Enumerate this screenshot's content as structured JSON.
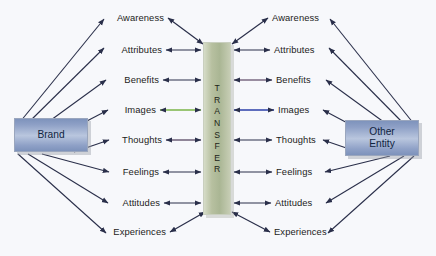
{
  "diagram": {
    "background_color": "#f7f8fb"
  },
  "entities": {
    "brand": {
      "label": "Brand",
      "color": "#8ea0c6"
    },
    "other": {
      "label_line1": "Other",
      "label_line2": "Entity",
      "color": "#8ea0c6"
    },
    "transfer": {
      "label": "TRANSFER",
      "letters": [
        "T",
        "R",
        "A",
        "N",
        "S",
        "F",
        "E",
        "R"
      ],
      "color": "#b7c0a0"
    }
  },
  "association_rows": [
    {
      "index": 0,
      "left_label": "Awareness",
      "right_label": "Awareness",
      "left_connector_color": "#2a2f4a",
      "right_connector_color": "#2a2f4a",
      "connector_style": "diagonal-double"
    },
    {
      "index": 1,
      "left_label": "Attributes",
      "right_label": "Attributes",
      "left_connector_color": "#2a2f4a",
      "right_connector_color": "#2a2f4a",
      "connector_style": "double-arrow"
    },
    {
      "index": 2,
      "left_label": "Benefits",
      "right_label": "Benefits",
      "left_connector_color": "#2a2f4a",
      "right_connector_color": "#7a6a82",
      "connector_style": "double-arrow"
    },
    {
      "index": 3,
      "left_label": "Images",
      "right_label": "Images",
      "left_connector_color": "#7ab547",
      "right_connector_color": "#2b3fa8",
      "connector_style": "double-arrow"
    },
    {
      "index": 4,
      "left_label": "Thoughts",
      "right_label": "Thoughts",
      "left_connector_color": "#6d5f77",
      "right_connector_color": "#2a2f4a",
      "connector_style": "double-arrow"
    },
    {
      "index": 5,
      "left_label": "Feelings",
      "right_label": "Feelings",
      "left_connector_color": "#2a2f4a",
      "right_connector_color": "#2a2f4a",
      "connector_style": "double-arrow"
    },
    {
      "index": 6,
      "left_label": "Attitudes",
      "right_label": "Attitudes",
      "left_connector_color": "#2a2f4a",
      "right_connector_color": "#2a2f4a",
      "connector_style": "double-arrow"
    },
    {
      "index": 7,
      "left_label": "Experiences",
      "right_label": "Experiences",
      "left_connector_color": "#2a2f4a",
      "right_connector_color": "#2a2f4a",
      "connector_style": "diagonal-double"
    }
  ],
  "colors": {
    "arrow": "#2a2f4a",
    "green_arrow": "#7ab547",
    "blue_arrow": "#2b3fa8",
    "mauve_arrow": "#7a6a82",
    "entity_fill": "#8ea0c6",
    "transfer_fill": "#b7c0a0",
    "text": "#1c1c22"
  }
}
